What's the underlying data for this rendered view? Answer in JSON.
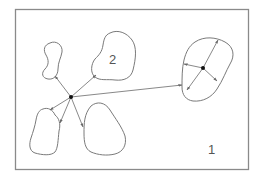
{
  "diagram": {
    "type": "cluster-distance-sketch",
    "colors": {
      "frame": "#8a8a8a",
      "outline": "#7a7a7a",
      "arrow": "#6a6a6a",
      "node": "#111111",
      "label": "#555555"
    },
    "labels": {
      "region_1": "1",
      "region_2": "2"
    },
    "nodes": [
      {
        "id": "left-center",
        "x": 71,
        "y": 97
      },
      {
        "id": "right-center",
        "x": 203,
        "y": 68
      }
    ],
    "shapes": [
      {
        "id": "kidney-blob",
        "label": ""
      },
      {
        "id": "blob-2",
        "label": "2"
      },
      {
        "id": "lower-left-blob",
        "label": ""
      },
      {
        "id": "lower-middle-blob",
        "label": ""
      },
      {
        "id": "right-blob",
        "label": ""
      }
    ],
    "arrows": [
      {
        "from": "left-center",
        "to": [
          55,
          76
        ]
      },
      {
        "from": "left-center",
        "to": [
          96,
          75
        ]
      },
      {
        "from": "left-center",
        "to": [
          50,
          110
        ]
      },
      {
        "from": "left-center",
        "to": [
          60,
          123
        ]
      },
      {
        "from": "left-center",
        "to": [
          83,
          127
        ]
      },
      {
        "from": "left-center",
        "to": [
          182,
          85
        ]
      },
      {
        "from": "right-center",
        "to": [
          218,
          40
        ]
      },
      {
        "from": "right-center",
        "to": [
          184,
          64
        ]
      },
      {
        "from": "right-center",
        "to": [
          187,
          90
        ]
      },
      {
        "from": "right-center",
        "to": [
          217,
          81
        ]
      }
    ]
  }
}
